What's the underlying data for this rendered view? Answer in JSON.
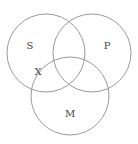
{
  "diagram": {
    "type": "venn",
    "colors": {
      "stroke": "#9a9a9a",
      "label": "#444444",
      "background": "#ffffff"
    },
    "sets": [
      {
        "id": "S",
        "label": "S",
        "cx": 46,
        "cy": 53,
        "r": 39,
        "label_x": 30,
        "label_y": 45
      },
      {
        "id": "P",
        "label": "P",
        "cx": 92,
        "cy": 53,
        "r": 39,
        "label_x": 107,
        "label_y": 45
      },
      {
        "id": "M",
        "label": "M",
        "cx": 70,
        "cy": 96,
        "r": 39,
        "label_x": 70,
        "label_y": 113
      }
    ],
    "points": [
      {
        "label": "X",
        "x": 38,
        "y": 71,
        "region": "S ∩ M (not P)"
      }
    ]
  }
}
